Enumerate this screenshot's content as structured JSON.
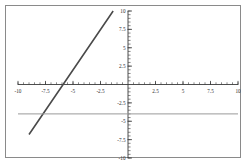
{
  "chart_data": {
    "type": "line",
    "title": "",
    "xlabel": "",
    "ylabel": "",
    "xlim": [
      -10,
      10
    ],
    "ylim": [
      -10,
      10
    ],
    "grid": false,
    "legend": "none",
    "axes": {
      "x_tick_labels": [
        "-10",
        "-7.5",
        "-5",
        "-2.5",
        "2.5",
        "5",
        "7.5",
        "10"
      ],
      "x_tick_values": [
        -10,
        -7.5,
        -5,
        -2.5,
        2.5,
        5,
        7.5,
        10
      ],
      "y_tick_labels": [
        "10",
        "7.5",
        "5",
        "2.5",
        "-2.5",
        "-5",
        "-7.5",
        "-10"
      ],
      "y_tick_values": [
        10,
        7.5,
        5,
        2.5,
        -2.5,
        -5,
        -7.5,
        -10
      ],
      "minor_tick_step": 0.5,
      "axis_color": "#3a3a3a"
    },
    "series": [
      {
        "name": "sloped-line",
        "type": "line",
        "color": "#4a4a4a",
        "width": 1.6,
        "slope": 2.2,
        "intercept": 13.0,
        "x_intercept": -5.9,
        "points": [
          {
            "x": -9.0,
            "y": -6.8
          },
          {
            "x": -5.9,
            "y": 0
          },
          {
            "x": -1.35,
            "y": 10
          }
        ]
      },
      {
        "name": "horizontal-line",
        "type": "line",
        "color": "#9a9a9a",
        "width": 1.0,
        "slope": 0,
        "intercept": -4.0,
        "points": [
          {
            "x": -10,
            "y": -4.0
          },
          {
            "x": 10,
            "y": -4.0
          }
        ]
      }
    ]
  },
  "figure": {
    "border_color": "#8a8a8a",
    "background": "#ffffff"
  }
}
